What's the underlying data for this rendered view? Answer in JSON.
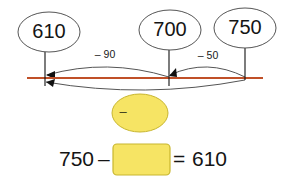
{
  "figure": {
    "type": "number-line-subtraction-diagram",
    "background_color": "#FFFFFF",
    "line_color": "#C05028",
    "arc_color": "#555555",
    "tick_color": "#111111",
    "bubble_fill": "#FFFFFF",
    "bubble_stroke": "#555555",
    "shape_fill": "#F6E464",
    "shape_stroke": "#C8B62E",
    "text_color": "#141414"
  },
  "number_line": {
    "label": "number-line",
    "start_x": 27,
    "end_x": 263,
    "y": 78,
    "ticks": [
      {
        "name": "tick-610",
        "x": 45,
        "value": "610"
      },
      {
        "name": "tick-700",
        "x": 169,
        "value": "700"
      },
      {
        "name": "tick-750",
        "x": 245,
        "value": "750"
      }
    ]
  },
  "bubbles": [
    {
      "name": "bubble-610",
      "label": "610",
      "cx": 49,
      "cy": 32,
      "rx": 31,
      "ry": 20
    },
    {
      "name": "bubble-700",
      "label": "700",
      "cx": 170,
      "cy": 30,
      "rx": 31,
      "ry": 20
    },
    {
      "name": "bubble-750",
      "label": "750",
      "cx": 245,
      "cy": 28,
      "rx": 31,
      "ry": 20
    }
  ],
  "jumps": [
    {
      "name": "jump-minus-90",
      "label": "– 90",
      "label_x": 105,
      "label_y": 55,
      "from_x": 169,
      "to_x": 45,
      "side": "above",
      "from_value": "700",
      "to_value": "610",
      "amount": -90
    },
    {
      "name": "jump-minus-50",
      "label": "– 50",
      "label_x": 208,
      "label_y": 56,
      "from_x": 245,
      "to_x": 169,
      "side": "above",
      "from_value": "750",
      "to_value": "700",
      "amount": -50
    },
    {
      "name": "jump-total",
      "label": "",
      "from_x": 245,
      "to_x": 45,
      "side": "below",
      "from_value": "750",
      "to_value": "610",
      "amount": -140
    }
  ],
  "answer_shape": {
    "name": "answer-ellipse",
    "operator_label": "–",
    "cx": 140,
    "cy": 113,
    "rx": 28,
    "ry": 19,
    "value": ""
  },
  "equation": {
    "name": "equation-row",
    "minuend": "750",
    "operator": "–",
    "blank_box": {
      "name": "answer-box",
      "value": "",
      "x": 113,
      "y": 144,
      "width": 57,
      "height": 31
    },
    "equals": "=",
    "result": "610",
    "full_text": "750 – ☐ = 610"
  }
}
